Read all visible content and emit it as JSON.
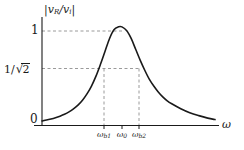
{
  "chart_data": {
    "type": "line",
    "title": "",
    "subtitle": "",
    "ylabel": "|v_R/v_i|",
    "ylabel_parts": {
      "numerator": "v",
      "numerator_sub": "R",
      "denominator": "v",
      "denominator_sub": "i"
    },
    "xlabel": "ω",
    "xlim": [
      0,
      1
    ],
    "ylim": [
      0,
      1.1
    ],
    "grid": false,
    "legend": null,
    "y_ticks": [
      {
        "value": 0,
        "label": "0"
      },
      {
        "value": 0.7071,
        "label": "1/√2"
      },
      {
        "value": 1,
        "label": "1"
      }
    ],
    "x_ticks": [
      {
        "label": "ω",
        "sub": "b1",
        "value": 0.358,
        "pixel_x": 104
      },
      {
        "label": "ω",
        "sub": "0",
        "value": 0.462,
        "pixel_x": 122
      },
      {
        "label": "ω",
        "sub": "b2",
        "value": 0.561,
        "pixel_x": 139
      }
    ],
    "annotations": [
      {
        "type": "dashed-horizontal",
        "y": 1,
        "from_x": 0,
        "to_x": 0.462,
        "label": "peak level"
      },
      {
        "type": "dashed-horizontal",
        "y": 0.7071,
        "from_x": 0,
        "to_x": 0.561,
        "label": "half-power level"
      },
      {
        "type": "dashed-vertical",
        "x": 0.358,
        "from_y": 0,
        "to_y": 0.7071,
        "label": "lower cutoff"
      },
      {
        "type": "dashed-vertical",
        "x": 0.561,
        "from_y": 0,
        "to_y": 0.7071,
        "label": "upper cutoff"
      }
    ],
    "series": [
      {
        "name": "magnitude response",
        "color": "#1a1a1a",
        "peak_value": 1.0,
        "peak_x": 0.462,
        "x": [
          0.0,
          0.026,
          0.052,
          0.078,
          0.104,
          0.13,
          0.156,
          0.182,
          0.208,
          0.234,
          0.26,
          0.286,
          0.312,
          0.338,
          0.364,
          0.39,
          0.416,
          0.442,
          0.462,
          0.49,
          0.516,
          0.542,
          0.568,
          0.594,
          0.62,
          0.646,
          0.672,
          0.698,
          0.724,
          0.75,
          0.802,
          0.854,
          0.906,
          0.958,
          1.0
        ],
        "y": [
          0.046,
          0.055,
          0.066,
          0.079,
          0.095,
          0.114,
          0.138,
          0.168,
          0.206,
          0.256,
          0.32,
          0.4,
          0.5,
          0.62,
          0.75,
          0.88,
          0.97,
          1.0,
          1.0,
          0.96,
          0.88,
          0.77,
          0.66,
          0.56,
          0.47,
          0.4,
          0.34,
          0.29,
          0.25,
          0.22,
          0.17,
          0.13,
          0.1,
          0.075,
          0.06
        ]
      }
    ],
    "axis_color": "#1a1a1a",
    "dash_color": "#9a9a9a",
    "background": "#ffffff"
  }
}
